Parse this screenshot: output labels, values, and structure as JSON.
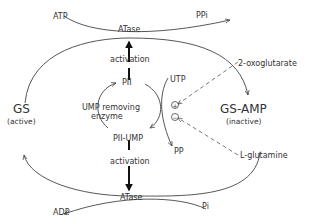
{
  "diagram": {
    "nodes": {
      "gs": {
        "label": "GS",
        "state": "(active)"
      },
      "gs_amp": {
        "label": "GS-AMP",
        "state": "(inactive)"
      },
      "pii": {
        "label": "PII"
      },
      "pii_ump": {
        "label": "PII-UMP"
      },
      "ump_removing_enzyme": {
        "line1": "UMP removing",
        "line2": "enzyme"
      }
    },
    "top_reaction": {
      "enzyme": "ATase",
      "substrate": "ATP",
      "product": "PPi",
      "regulator_label": "activation"
    },
    "bottom_reaction": {
      "enzyme": "ATase",
      "product_left": "ADP",
      "product_right": "Pi",
      "regulator_label": "activation"
    },
    "uridylylation": {
      "substrate": "UTP",
      "product": "PP"
    },
    "effectors": {
      "positive": {
        "name": "2-oxoglutarate",
        "sign": "+"
      },
      "negative": {
        "name": "L-glutamine",
        "sign": "−"
      }
    },
    "colors": {
      "line": "#444444",
      "text": "#333333",
      "background": "#ffffff"
    }
  }
}
